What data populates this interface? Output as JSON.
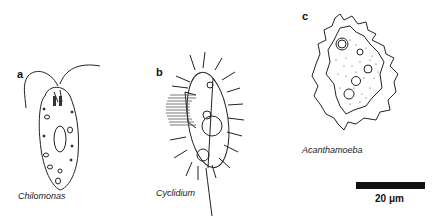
{
  "figure": {
    "panels": [
      {
        "letter": "a",
        "species": "Chilomonas"
      },
      {
        "letter": "b",
        "species": "Cyclidium"
      },
      {
        "letter": "c",
        "species": "Acanthamoeba"
      }
    ],
    "scale_bar": {
      "label": "20 μm"
    }
  }
}
